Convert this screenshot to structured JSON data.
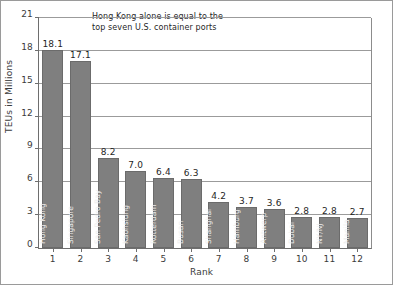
{
  "chart_data": {
    "type": "bar",
    "title": "",
    "subtitle": "",
    "xlabel": "Rank",
    "ylabel": "TEUs in Millions",
    "ylim": [
      0,
      21
    ],
    "y_ticks": [
      0,
      3,
      6,
      9,
      12,
      15,
      18,
      21
    ],
    "y_tick_labels": [
      "0",
      "3",
      "6",
      "9",
      "12",
      "15",
      "18",
      "21"
    ],
    "grid": true,
    "grid_axis": "y",
    "legend": null,
    "legend_position": "none",
    "bar_color": "#7f7f7f",
    "bar_edge_color": "#6b6b6b",
    "categories": [
      "1",
      "2",
      "3",
      "4",
      "5",
      "6",
      "7",
      "8",
      "9",
      "10",
      "11",
      "12"
    ],
    "x_tick_labels": [
      "1",
      "2",
      "3",
      "4",
      "5",
      "6",
      "7",
      "8",
      "9",
      "10",
      "11",
      "12"
    ],
    "values": [
      18.1,
      17.1,
      8.2,
      7.0,
      6.4,
      6.3,
      4.2,
      3.7,
      3.6,
      2.8,
      2.8,
      2.7
    ],
    "value_labels": [
      "18.1",
      "17.1",
      "8.2",
      "7.0",
      "6.4",
      "6.3",
      "4.2",
      "3.7",
      "3.6",
      "2.8",
      "2.8",
      "2.7"
    ],
    "bar_labels": [
      "Hong Kong",
      "Singapore",
      "San Pedro Bay",
      "Kaohsiung",
      "Rotterdam",
      "Busan",
      "Shanghai",
      "Hamburg",
      "Antwerp",
      "Dubai",
      "NY/NJ",
      "Manila"
    ],
    "annotations": [
      {
        "text": "Hong Kong alone is equal to the\ntop seven U.S. container ports",
        "x": 92,
        "y": 11
      }
    ]
  },
  "annotation": {
    "text": "Hong Kong alone is equal to the\ntop seven U.S. container ports"
  },
  "axes": {
    "y_title": "TEUs in Millions",
    "x_title": "Rank"
  }
}
